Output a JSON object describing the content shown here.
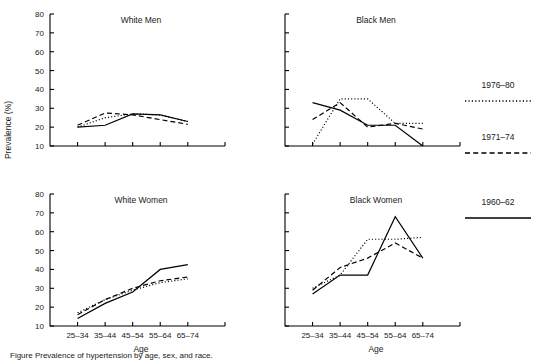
{
  "figure": {
    "ylabel": "Prevalence (%)",
    "xlabel": "Age",
    "caption": "Figure  Prevalence of hypertension by age, sex, and race."
  },
  "legend": {
    "position": "right",
    "entries": [
      {
        "label": "1976–80",
        "style": "dotted"
      },
      {
        "label": "1971–74",
        "style": "dashed"
      },
      {
        "label": "1960–62",
        "style": "solid"
      }
    ]
  },
  "axes": {
    "y_ticks": [
      "80",
      "70",
      "60",
      "50",
      "40",
      "30",
      "20",
      "10"
    ],
    "x_ticks": [
      "25–34",
      "35–44",
      "45–54",
      "55–64",
      "65–74"
    ],
    "ylim": [
      10,
      80
    ],
    "ystep": 10
  },
  "panels": [
    {
      "id": "white-men",
      "title": "White Men",
      "xlabel": "",
      "show_y_ticklabels": true,
      "show_x_ticklabels": false
    },
    {
      "id": "black-men",
      "title": "Black Men",
      "xlabel": "",
      "show_y_ticklabels": false,
      "show_x_ticklabels": false
    },
    {
      "id": "white-women",
      "title": "White Women",
      "xlabel": "Age",
      "show_y_ticklabels": true,
      "show_x_ticklabels": true
    },
    {
      "id": "black-women",
      "title": "Black Women",
      "xlabel": "Age",
      "show_y_ticklabels": false,
      "show_x_ticklabels": true
    }
  ],
  "chart_data": {
    "type": "line",
    "title": "Prevalence of hypertension by age, sex, and race",
    "xlabel": "Age",
    "ylabel": "Prevalence (%)",
    "categories": [
      "25–34",
      "35–44",
      "45–54",
      "55–64",
      "65–74"
    ],
    "ylim": [
      10,
      80
    ],
    "grid": false,
    "legend_position": "right",
    "panels": [
      {
        "name": "White Men",
        "series": [
          {
            "name": "1976–80",
            "style": "dotted",
            "values": [
              20,
              25,
              27,
              26.5,
              23
            ]
          },
          {
            "name": "1971–74",
            "style": "dashed",
            "values": [
              21,
              27.5,
              26.5,
              24,
              21.5
            ]
          },
          {
            "name": "1960–62",
            "style": "solid",
            "values": [
              20,
              21,
              27,
              26.5,
              23
            ]
          }
        ]
      },
      {
        "name": "Black Men",
        "series": [
          {
            "name": "1976–80",
            "style": "dotted",
            "values": [
              11,
              35,
              35,
              22,
              22
            ]
          },
          {
            "name": "1971–74",
            "style": "dashed",
            "values": [
              24,
              33,
              20,
              22,
              19
            ]
          },
          {
            "name": "1960–62",
            "style": "solid",
            "values": [
              33,
              29,
              21,
              21,
              10
            ]
          }
        ]
      },
      {
        "name": "White Women",
        "series": [
          {
            "name": "1976–80",
            "style": "dotted",
            "values": [
              17,
              24,
              29,
              33,
              35
            ]
          },
          {
            "name": "1971–74",
            "style": "dashed",
            "values": [
              16,
              24,
              30,
              34,
              36
            ]
          },
          {
            "name": "1960–62",
            "style": "solid",
            "values": [
              14,
              22,
              28,
              40,
              42.5
            ]
          }
        ]
      },
      {
        "name": "Black Women",
        "series": [
          {
            "name": "1976–80",
            "style": "dotted",
            "values": [
              30,
              37,
              56,
              56,
              57
            ]
          },
          {
            "name": "1971–74",
            "style": "dashed",
            "values": [
              29,
              41,
              46,
              54,
              46
            ]
          },
          {
            "name": "1960–62",
            "style": "solid",
            "values": [
              27,
              37,
              37,
              68,
              46
            ]
          }
        ]
      }
    ]
  }
}
